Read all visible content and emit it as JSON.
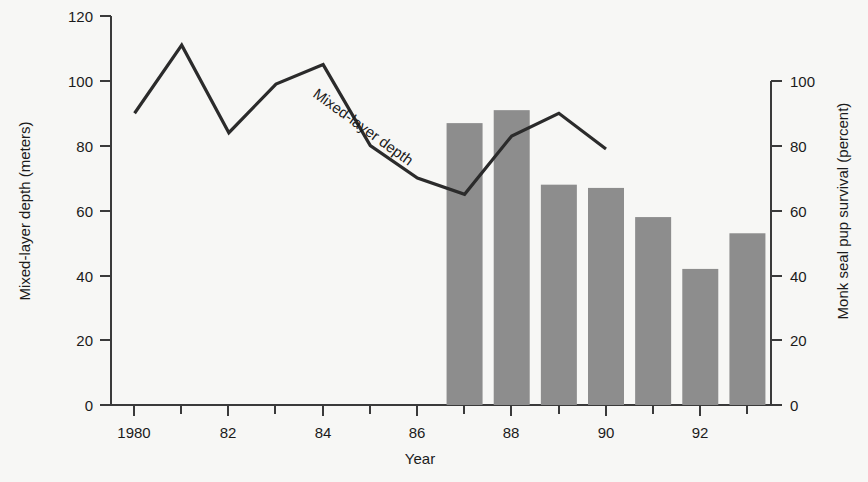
{
  "chart_data": {
    "type": "bar",
    "title": "",
    "xlabel": "Year",
    "x": [
      1980,
      1981,
      1982,
      1983,
      1984,
      1985,
      1986,
      1987,
      1988,
      1989,
      1990,
      1991,
      1992,
      1993
    ],
    "xlim": [
      1979.5,
      1993.5
    ],
    "x_major_ticks": [
      1980,
      1982,
      1984,
      1986,
      1988,
      1990,
      1992
    ],
    "x_major_tick_labels": [
      "1980",
      "82",
      "84",
      "86",
      "88",
      "90",
      "92"
    ],
    "x_minor_ticks": [
      1981,
      1983,
      1985,
      1987,
      1989,
      1991,
      1993
    ],
    "grid": false,
    "legend_position": "none",
    "series": [
      {
        "name": "Mixed-layer depth",
        "type": "line",
        "axis": "left",
        "ylabel": "Mixed-layer depth (meters)",
        "ylim": [
          0,
          120
        ],
        "yticks": [
          0,
          20,
          40,
          60,
          80,
          100,
          120
        ],
        "ytick_labels": [
          "0",
          "20",
          "40",
          "60",
          "80",
          "100",
          "120"
        ],
        "color": "#2b2b2b",
        "x": [
          1980,
          1981,
          1982,
          1983,
          1984,
          1985,
          1986,
          1987,
          1988,
          1989,
          1990
        ],
        "values": [
          90,
          111,
          84,
          99,
          105,
          80,
          70,
          65,
          83,
          90,
          79
        ],
        "annotation": "Mixed-layer depth"
      },
      {
        "name": "Monk seal pup survival",
        "type": "bar",
        "axis": "right",
        "ylabel": "Monk seal pup survival (percent)",
        "ylim": [
          0,
          100
        ],
        "yticks": [
          0,
          20,
          40,
          60,
          80,
          100
        ],
        "ytick_labels": [
          "0",
          "20",
          "40",
          "60",
          "80",
          "100"
        ],
        "color": "#8d8d8d",
        "x": [
          1987,
          1988,
          1989,
          1990,
          1991,
          1992,
          1993
        ],
        "values": [
          87,
          91,
          68,
          67,
          58,
          42,
          53
        ]
      }
    ]
  },
  "axes": {
    "left": {
      "title": "Mixed-layer depth (meters)",
      "ticks": [
        "120",
        "100",
        "80",
        "60",
        "40",
        "20",
        "0"
      ]
    },
    "right": {
      "title": "Monk seal pup survival (percent)",
      "ticks": [
        "100",
        "80",
        "60",
        "40",
        "20",
        "0"
      ]
    },
    "bottom": {
      "title": "Year",
      "ticks": [
        "1980",
        "82",
        "84",
        "86",
        "88",
        "90",
        "92"
      ]
    }
  },
  "annotations": {
    "line_label": "Mixed-layer depth"
  },
  "colors": {
    "background": "#f7f7f5",
    "bar": "#8d8d8d",
    "line": "#2b2b2b",
    "axis": "#3a3a3a",
    "text": "#1b1b1b"
  }
}
